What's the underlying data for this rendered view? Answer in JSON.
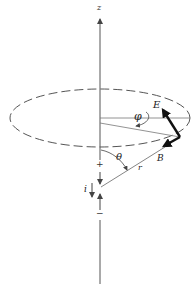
{
  "diagram": {
    "labels": {
      "z_axis": "z",
      "electric_field": "E",
      "magnetic_field": "B",
      "azimuth_angle": "φ",
      "polar_angle": "θ",
      "radius": "r",
      "current": "i",
      "plus_charge": "+",
      "minus_charge": "−"
    },
    "colors": {
      "line": "#555555",
      "vector": "#111111",
      "background": "#ffffff"
    }
  }
}
